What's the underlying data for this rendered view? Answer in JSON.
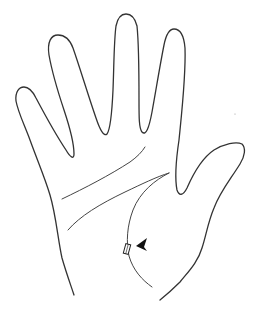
{
  "figure": {
    "colors": {
      "background": "#ffffff",
      "ink": "#333333",
      "marker": "#111111"
    },
    "elements": {
      "hand_outline": "hand-outline",
      "heart_line": "palm-line-upper",
      "head_line": "palm-line-lower",
      "life_line": "palm-line-thenar",
      "marker": "rectangle-marker",
      "pointer": "arrowhead-pointer-left"
    }
  }
}
